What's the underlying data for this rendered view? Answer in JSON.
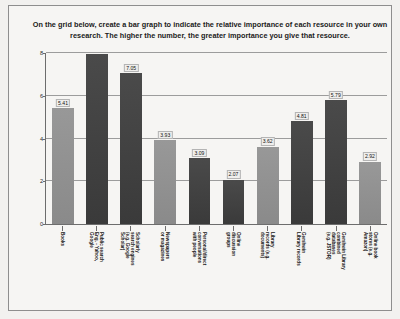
{
  "prompt": {
    "line1": "On the grid below, create a bar graph to indicate the relative importance of each resource in your",
    "line2": "own research.  The higher the number, the greater importance you give that resource."
  },
  "chart_data": {
    "type": "bar",
    "title": "",
    "xlabel": "",
    "ylabel": "",
    "ylim": [
      0,
      8
    ],
    "yticks": [
      "0",
      "2",
      "4",
      "6",
      "8"
    ],
    "grid": true,
    "legend": "none",
    "categories": [
      "Books",
      "Public search Eng. - Yahoo, Google",
      "Scholarly search engines (e.g. Google Scholar)",
      "Newspapers or magazines",
      "Personal/direct conversations with people",
      "Online discussion groups",
      "Library records (e.g. documents)",
      "Gershwin Library records",
      "Gershwin Library combined databases (e.g. JSTOR)",
      "Online book stores (e.g. Amazon)"
    ],
    "values": [
      5.41,
      7.95,
      7.05,
      3.93,
      3.09,
      2.07,
      3.62,
      4.81,
      5.79,
      2.92
    ],
    "value_labels": [
      "5.41",
      "",
      "7.05",
      "3.93",
      "3.09",
      "2.07",
      "3.62",
      "4.81",
      "5.79",
      "2.92"
    ],
    "bar_shades": [
      "light",
      "dark",
      "dark",
      "light",
      "dark",
      "dark",
      "light",
      "dark",
      "dark",
      "light"
    ],
    "colors": {
      "light": "#8f8f8f",
      "dark": "#3f3f3f",
      "axis": "#6d6d6d",
      "grid": "#9c9c9c",
      "page": "#f6f5f3"
    },
    "label_lines": [
      [
        "Books"
      ],
      [
        "Public search",
        "Eng. - Yahoo,",
        "Google"
      ],
      [
        "Scholarly",
        "search engines",
        "(e.g. Google",
        "Scholar)"
      ],
      [
        "Newspapers",
        "or magazines"
      ],
      [
        "Personal/direct",
        "conversations",
        "with people"
      ],
      [
        "Online",
        "discussion",
        "groups"
      ],
      [
        "Library",
        "records (e.g.",
        "documents)"
      ],
      [
        "Gershwin",
        "Library records"
      ],
      [
        "Gershwin Library",
        "combined",
        "databases",
        "(e.g. JSTOR)"
      ],
      [
        "Online book",
        "stores (e.g.",
        "Amazon)"
      ]
    ]
  }
}
